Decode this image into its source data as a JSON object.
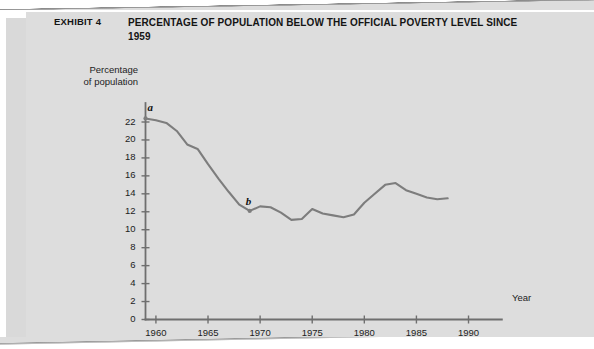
{
  "exhibit": {
    "label": "EXHIBIT 4",
    "title": "PERCENTAGE OF POPULATION BELOW THE OFFICIAL POVERTY LEVEL SINCE 1959"
  },
  "colors": {
    "page_background": "#ffffff",
    "panel_background": "#dddddd",
    "stack_edge": "#d9d9d9",
    "line": "#7d7d7d",
    "axis": "#6f6f6f",
    "text": "#1c1c1c"
  },
  "chart_data": {
    "type": "line",
    "title": "PERCENTAGE OF POPULATION BELOW THE OFFICIAL POVERTY LEVEL SINCE 1959",
    "xlabel": "Year",
    "ylabel": "Percentage of population",
    "xlim": [
      1959,
      1992
    ],
    "ylim": [
      0,
      23
    ],
    "grid": false,
    "legend": "none",
    "x_ticks": [
      1960,
      1965,
      1970,
      1975,
      1980,
      1985,
      1990
    ],
    "y_ticks": [
      0,
      2,
      4,
      6,
      8,
      10,
      12,
      14,
      16,
      18,
      20,
      22
    ],
    "series": [
      {
        "name": "Percentage of population below poverty level",
        "x": [
          1959,
          1960,
          1961,
          1962,
          1963,
          1964,
          1965,
          1966,
          1967,
          1968,
          1969,
          1970,
          1971,
          1972,
          1973,
          1974,
          1975,
          1976,
          1977,
          1978,
          1979,
          1980,
          1981,
          1982,
          1983,
          1984,
          1985,
          1986,
          1987,
          1988
        ],
        "values": [
          22.4,
          22.2,
          21.9,
          21.0,
          19.5,
          19.0,
          17.3,
          15.7,
          14.2,
          12.8,
          12.1,
          12.6,
          12.5,
          11.9,
          11.1,
          11.2,
          12.3,
          11.8,
          11.6,
          11.4,
          11.7,
          13.0,
          14.0,
          15.0,
          15.2,
          14.4,
          14.0,
          13.6,
          13.4,
          13.5
        ]
      }
    ],
    "annotations": [
      {
        "text": "a",
        "x": 1959,
        "y": 22.4,
        "label_offset": "above-right"
      },
      {
        "text": "b",
        "x": 1969,
        "y": 12.1,
        "label_offset": "above-right"
      }
    ]
  },
  "corner": {
    "mark": ""
  }
}
